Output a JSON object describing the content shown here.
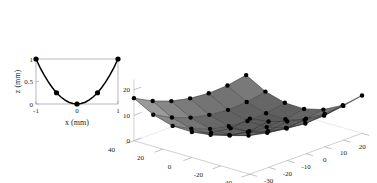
{
  "figure": {
    "background_color": "#ffffff",
    "axis_color": "#9a9a9a",
    "marker_color": "#000000",
    "curve_color": "#000000",
    "surface_color_light": "#e8e8e8",
    "surface_color_dark": "#6f6f6f"
  },
  "chart_data": [
    {
      "type": "line",
      "id": "parabola-2d",
      "title": "",
      "xlabel": "x (mm)",
      "ylabel": "z (mm)",
      "xlim": [
        -1.15,
        1.15
      ],
      "ylim": [
        -0.08,
        1.08
      ],
      "grid": false,
      "xticks": [
        -1,
        0,
        1
      ],
      "xticklabels": [
        "-1",
        "0",
        "1"
      ],
      "yticks": [
        0,
        0.5,
        1
      ],
      "yticklabels": [
        "0",
        "0.5",
        "1"
      ],
      "series": [
        {
          "name": "z = x^2",
          "marker": "filled-circle",
          "x": [
            -1,
            -0.5,
            0,
            0.5,
            1
          ],
          "values": [
            1,
            0.25,
            0,
            0.25,
            1
          ]
        }
      ],
      "curve": {
        "name": "z = x^2 fit",
        "x": [
          -1,
          -0.9,
          -0.8,
          -0.7,
          -0.6,
          -0.5,
          -0.4,
          -0.3,
          -0.2,
          -0.1,
          0,
          0.1,
          0.2,
          0.3,
          0.4,
          0.5,
          0.6,
          0.7,
          0.8,
          0.9,
          1
        ],
        "values": [
          1,
          0.81,
          0.64,
          0.49,
          0.36,
          0.25,
          0.16,
          0.09,
          0.04,
          0.01,
          0,
          0.01,
          0.04,
          0.09,
          0.16,
          0.25,
          0.36,
          0.49,
          0.64,
          0.81,
          1
        ]
      }
    },
    {
      "type": "surface",
      "id": "paraboloid-3d",
      "title": "",
      "xlabel": "",
      "ylabel": "",
      "zlabel": "",
      "grid": true,
      "legend": "none",
      "x_axis": {
        "ticks": [
          40,
          20,
          0,
          -20,
          -40
        ],
        "ticklabels": [
          "40",
          "20",
          "0",
          "-20",
          "-40"
        ],
        "range": [
          -40,
          40
        ]
      },
      "y_axis": {
        "ticks": [
          -30,
          -20,
          -10,
          0,
          10,
          20,
          30
        ],
        "ticklabels": [
          "-30",
          "-20",
          "-10",
          "0",
          "10",
          "20",
          "30"
        ],
        "range": [
          -30,
          30
        ]
      },
      "z_axis": {
        "ticks": [
          0,
          10,
          20
        ],
        "ticklabels": [
          "0",
          "10",
          "20"
        ],
        "range": [
          0,
          24
        ]
      },
      "mesh": {
        "nx": 7,
        "ny": 7,
        "marker": "filled-circle",
        "x": [
          -40,
          -26.7,
          -13.3,
          0,
          13.3,
          26.7,
          40
        ],
        "y": [
          -30,
          -20,
          -10,
          0,
          10,
          20,
          30
        ],
        "z_formula": "z = (x^2/135) + (y^2/90)",
        "z": [
          [
            21.8,
            18.0,
            15.3,
            13.7,
            13.0,
            13.4,
            14.8
          ],
          [
            15.8,
            12.0,
            9.3,
            7.7,
            7.0,
            7.4,
            8.8
          ],
          [
            11.9,
            8.1,
            5.4,
            3.8,
            3.1,
            3.5,
            4.9
          ],
          [
            10.0,
            6.2,
            3.5,
            1.9,
            1.2,
            1.6,
            3.0
          ],
          [
            10.2,
            6.4,
            3.7,
            2.1,
            1.4,
            1.8,
            3.2
          ],
          [
            12.4,
            8.6,
            5.9,
            4.3,
            3.6,
            4.0,
            5.4
          ],
          [
            16.7,
            12.9,
            10.2,
            8.6,
            7.9,
            8.3,
            9.7
          ]
        ]
      }
    }
  ]
}
